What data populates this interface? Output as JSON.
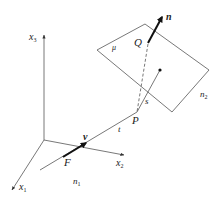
{
  "diagram": {
    "axes": {
      "x1": {
        "label": "x",
        "sub": "1"
      },
      "x2": {
        "label": "x",
        "sub": "2"
      },
      "x3": {
        "label": "x",
        "sub": "3"
      }
    },
    "points": {
      "F": "F",
      "P": "P",
      "Q": "Q"
    },
    "vectors": {
      "v": "v",
      "n": "n"
    },
    "labels": {
      "t": "t",
      "s": "s",
      "mu": "μ",
      "n1": {
        "label": "n",
        "sub": "1"
      },
      "n2": {
        "label": "n",
        "sub": "2"
      }
    },
    "colors": {
      "line": "#555555",
      "bold_vector": "#111111",
      "text": "#222222"
    }
  }
}
